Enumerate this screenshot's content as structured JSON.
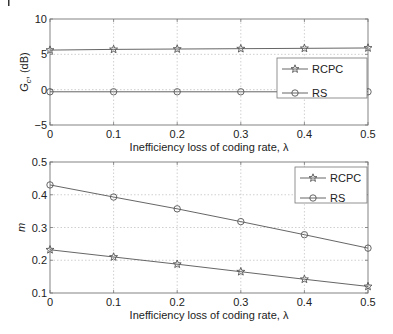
{
  "chart_data": [
    {
      "type": "line",
      "title": "",
      "xlabel": "Inefficiency loss of coding rate, λ",
      "ylabel": "G_c, (dB)",
      "x": [
        0,
        0.1,
        0.2,
        0.3,
        0.4,
        0.5
      ],
      "xlim": [
        0,
        0.5
      ],
      "ylim": [
        -5,
        10
      ],
      "xticks": [
        "0",
        "0.1",
        "0.2",
        "0.3",
        "0.4",
        "0.5"
      ],
      "yticks": [
        "−5",
        "0",
        "5",
        "10"
      ],
      "grid": true,
      "legend_position": "right-middle",
      "series": [
        {
          "name": "RCPC",
          "marker": "star",
          "values": [
            5.6,
            5.7,
            5.75,
            5.8,
            5.85,
            5.9
          ]
        },
        {
          "name": "RS",
          "marker": "circle",
          "values": [
            -0.3,
            -0.3,
            -0.3,
            -0.3,
            -0.3,
            -0.3
          ]
        }
      ]
    },
    {
      "type": "line",
      "title": "",
      "xlabel": "Inefficiency loss of coding rate, λ",
      "ylabel": "m",
      "x": [
        0,
        0.1,
        0.2,
        0.3,
        0.4,
        0.5
      ],
      "xlim": [
        0,
        0.5
      ],
      "ylim": [
        0.1,
        0.5
      ],
      "xticks": [
        "0",
        "0.1",
        "0.2",
        "0.3",
        "0.4",
        "0.5"
      ],
      "yticks": [
        "0.1",
        "0.2",
        "0.3",
        "0.4",
        "0.5"
      ],
      "grid": true,
      "legend_position": "upper-right",
      "series": [
        {
          "name": "RCPC",
          "marker": "star",
          "values": [
            0.232,
            0.21,
            0.188,
            0.165,
            0.142,
            0.12
          ]
        },
        {
          "name": "RS",
          "marker": "circle",
          "values": [
            0.43,
            0.393,
            0.357,
            0.318,
            0.278,
            0.237
          ]
        }
      ]
    }
  ],
  "top": {
    "xlabel": "Inefficiency loss of coding rate, λ",
    "ylabel_main": "G",
    "ylabel_sub": "c",
    "ylabel_rest": ", (dB)",
    "legend": [
      "RCPC",
      "RS"
    ]
  },
  "bottom": {
    "xlabel": "Inefficiency loss of coding rate, λ",
    "ylabel": "m",
    "legend": [
      "RCPC",
      "RS"
    ]
  }
}
